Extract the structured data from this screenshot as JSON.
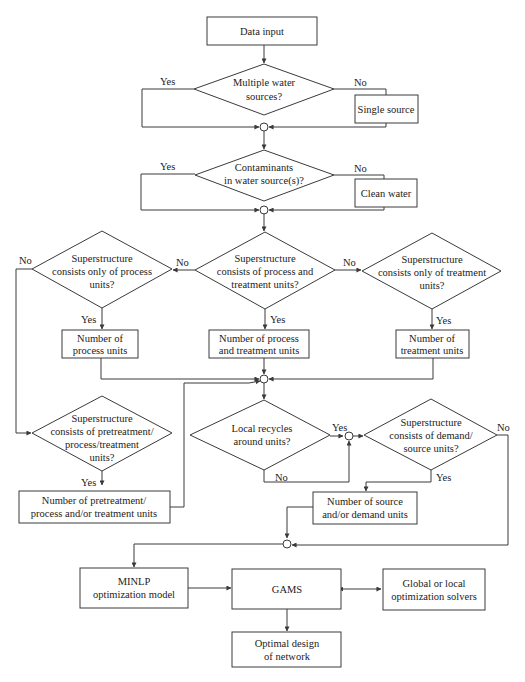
{
  "diagram": {
    "type": "flowchart",
    "colors": {
      "line": "#3a3a3a",
      "text": "#222222",
      "background": "#ffffff"
    },
    "nodes": {
      "data_input": {
        "lines": [
          "Data input"
        ]
      },
      "multiple_sources": {
        "lines": [
          "Multiple water",
          "sources?"
        ]
      },
      "single_source": {
        "lines": [
          "Single source"
        ]
      },
      "contaminants": {
        "lines": [
          "Contaminants",
          "in water source(s)?"
        ]
      },
      "clean_water": {
        "lines": [
          "Clean water"
        ]
      },
      "only_process": {
        "lines": [
          "Superstructure",
          "consists only of process",
          "units?"
        ]
      },
      "process_and_treatment": {
        "lines": [
          "Superstructure",
          "consists of process and",
          "treatment units?"
        ]
      },
      "only_treatment": {
        "lines": [
          "Superstructure",
          "consists only of treatment",
          "units?"
        ]
      },
      "num_process": {
        "lines": [
          "Number of",
          "process units"
        ]
      },
      "num_process_treatment": {
        "lines": [
          "Number of process",
          "and treatment units"
        ]
      },
      "num_treatment": {
        "lines": [
          "Number of",
          "treatment units"
        ]
      },
      "pretreatment_q": {
        "lines": [
          "Superstructure",
          "consists of pretreatment/",
          "process/treatment",
          "units?"
        ]
      },
      "num_pretreatment": {
        "lines": [
          "Number of pretreatment/",
          "process and/or treatment units"
        ]
      },
      "local_recycles": {
        "lines": [
          "Local recycles",
          "around units?"
        ]
      },
      "demand_source_q": {
        "lines": [
          "Superstructure",
          "consists of demand/",
          "source units?"
        ]
      },
      "num_source_demand": {
        "lines": [
          "Number of source",
          "and/or demand units"
        ]
      },
      "minlp": {
        "lines": [
          "MINLP",
          "optimization model"
        ]
      },
      "gams": {
        "lines": [
          "GAMS"
        ]
      },
      "solvers": {
        "lines": [
          "Global or local",
          "optimization solvers"
        ]
      },
      "optimal": {
        "lines": [
          "Optimal design",
          "of network"
        ]
      }
    },
    "edge_labels": {
      "d1_yes": "Yes",
      "d1_no": "No",
      "d2_yes": "Yes",
      "d2_no": "No",
      "left_no": "No",
      "left_yes": "Yes",
      "center_no_left": "No",
      "center_no_right": "No",
      "center_yes": "Yes",
      "right_yes": "Yes",
      "pretreat_yes": "Yes",
      "recycle_yes": "Yes",
      "recycle_no": "No",
      "demand_yes": "Yes",
      "demand_no": "No"
    }
  }
}
